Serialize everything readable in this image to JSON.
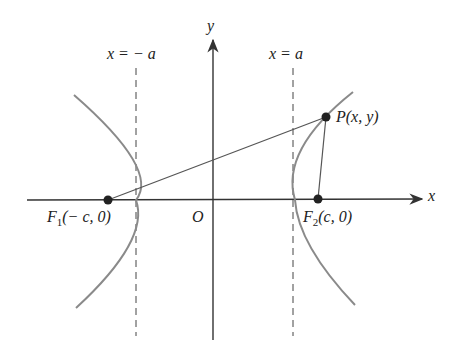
{
  "labels": {
    "y_axis": "y",
    "x_axis": "x",
    "origin": "O",
    "left_directrix": "x = − a",
    "right_directrix": "x = a",
    "point_p": "P(x, y)",
    "focus1_name": "F",
    "focus1_sub": "1",
    "focus1_coords": "(− c, 0)",
    "focus2_name": "F",
    "focus2_sub": "2",
    "focus2_coords": "(c, 0)"
  },
  "colors": {
    "axis": "#333333",
    "curve": "#8a8a8a",
    "line": "#555555",
    "point": "#222222"
  }
}
